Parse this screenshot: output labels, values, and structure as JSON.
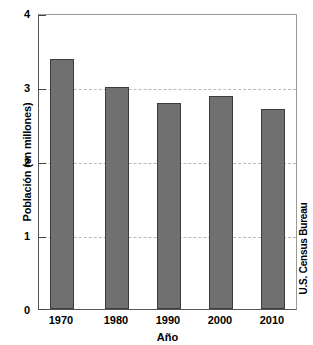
{
  "chart_data": {
    "type": "bar",
    "title": "",
    "categories": [
      "1970",
      "1980",
      "1990",
      "2000",
      "2010"
    ],
    "values": [
      3.4,
      3.02,
      2.8,
      2.9,
      2.72
    ],
    "series": [
      {
        "name": "Población",
        "values": [
          3.4,
          3.02,
          2.8,
          2.9,
          2.72
        ]
      }
    ],
    "xlabel": "Año",
    "ylabel": "Población (en millones)",
    "ylim": [
      0,
      4
    ],
    "xlim_categories": [
      "1970",
      "2010"
    ],
    "ytick_labels": [
      "0",
      "1",
      "2",
      "3",
      "4"
    ],
    "ytick_values": [
      0,
      1,
      2,
      3,
      4
    ],
    "grid": "horizontal-dashed-at-1-2-3",
    "gridlines_at": [
      1,
      2,
      3
    ],
    "legend": "none",
    "annotations": [
      "U.S. Census Bureau"
    ],
    "bar_color": "#707070",
    "bar_edge_color": "#3d3d3d",
    "grid_color": "#b9b9b9",
    "axis_color": "#555555",
    "background_color": "#ffffff"
  },
  "source_note": "U.S. Census Bureau"
}
